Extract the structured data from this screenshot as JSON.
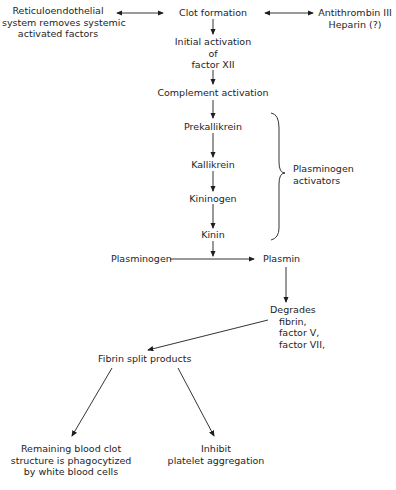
{
  "diagram": {
    "type": "flowchart",
    "nodes": {
      "reticulo": [
        "Reticuloendothelial",
        "system removes systemic",
        "activated factors"
      ],
      "clot": [
        "Clot formation"
      ],
      "antithrombin": [
        "Antithrombin III",
        "Heparin (?)"
      ],
      "initial": [
        "Initial activation",
        "of",
        "factor XII"
      ],
      "complement": [
        "Complement activation"
      ],
      "prekallikrein": [
        "Prekallikrein"
      ],
      "kallikrein": [
        "Kallikrein"
      ],
      "kininogen": [
        "Kininogen"
      ],
      "kinin": [
        "Kinin"
      ],
      "activators": [
        "Plasminogen",
        "activators"
      ],
      "plasminogen": [
        "Plasminogen"
      ],
      "plasmin": [
        "Plasmin"
      ],
      "degrades": [
        "Degrades",
        "fibrin,",
        "factor V,",
        "factor VII,"
      ],
      "fsp": [
        "Fibrin split products"
      ],
      "remaining": [
        "Remaining blood clot",
        "structure is phagocytized",
        "by white blood cells"
      ],
      "inhibit": [
        "Inhibit",
        "platelet aggregation"
      ]
    },
    "edges": [
      {
        "from": "reticulo",
        "to": "clot",
        "bidirectional": true
      },
      {
        "from": "clot",
        "to": "antithrombin",
        "bidirectional": true
      },
      {
        "from": "clot",
        "to": "initial"
      },
      {
        "from": "initial",
        "to": "complement"
      },
      {
        "from": "complement",
        "to": "prekallikrein"
      },
      {
        "from": "prekallikrein",
        "to": "kallikrein"
      },
      {
        "from": "kallikrein",
        "to": "kininogen"
      },
      {
        "from": "kininogen",
        "to": "kinin"
      },
      {
        "from": "kinin",
        "to": "plasminogen-plasmin-line"
      },
      {
        "from": "plasminogen",
        "to": "plasmin"
      },
      {
        "from": "plasmin",
        "to": "degrades"
      },
      {
        "from": "degrades",
        "to": "fsp"
      },
      {
        "from": "fsp",
        "to": "remaining"
      },
      {
        "from": "fsp",
        "to": "inhibit"
      }
    ],
    "brace_group": {
      "members": [
        "prekallikrein",
        "kallikrein",
        "kininogen",
        "kinin"
      ],
      "label": "activators"
    }
  }
}
